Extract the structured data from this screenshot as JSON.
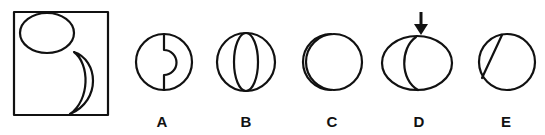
{
  "puzzle": {
    "question_panel": {
      "description": "Square frame containing an ellipse at top-left and a crescent shape at bottom-right"
    },
    "options": [
      {
        "label": "A",
        "description": "Circle with vertical divider having a right-bulging semicircular notch"
      },
      {
        "label": "B",
        "description": "Circle with an inscribed vertical ellipse"
      },
      {
        "label": "C",
        "description": "Circle with a thin crescent on the left edge"
      },
      {
        "label": "D",
        "description": "Ellipse with inner curved line, marked by arrow",
        "marked": true
      },
      {
        "label": "E",
        "description": "Circle with a diagonal chord on the left"
      }
    ],
    "marker": {
      "icon": "down-arrow-icon",
      "target": "D"
    },
    "colors": {
      "stroke": "#111111",
      "background": "#ffffff"
    }
  }
}
